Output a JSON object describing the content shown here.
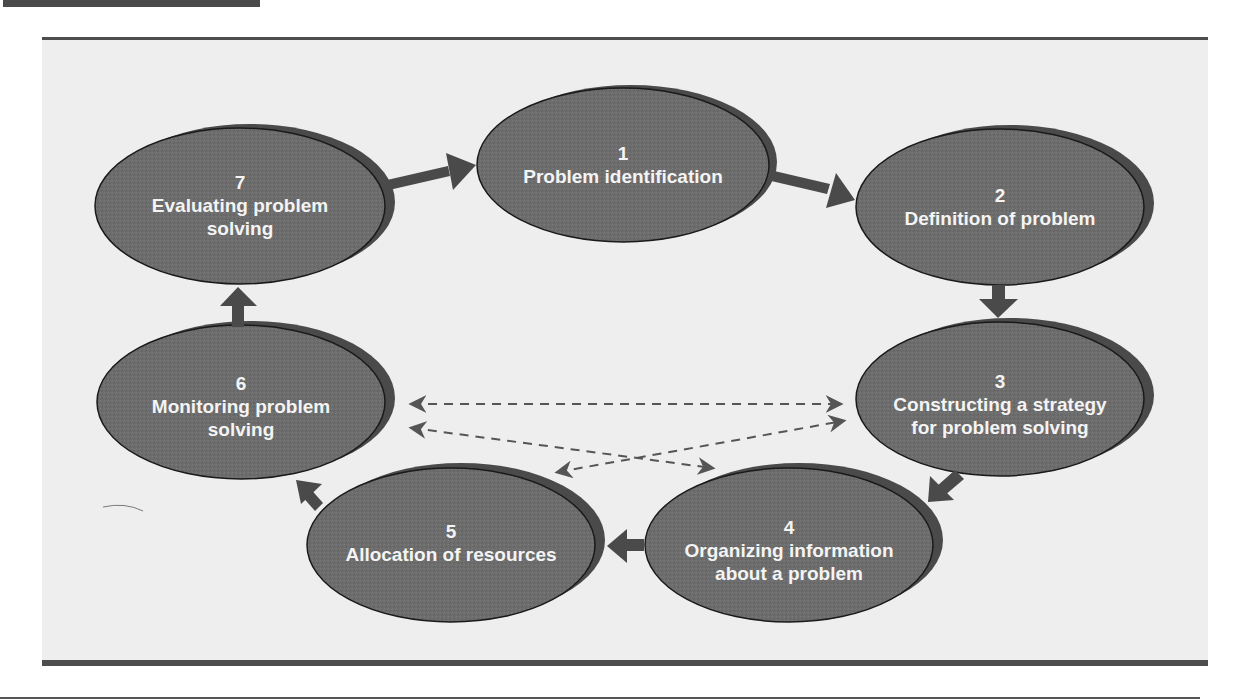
{
  "diagram": {
    "type": "cycle",
    "colors": {
      "node_fill": "#6b6b6b",
      "node_shadow": "#4a4a4a",
      "node_outline": "#1a1a1a",
      "arrow": "#4a4a4a",
      "dashed_arrow": "#555555",
      "label_text": "#f4f4f4",
      "panel_bg": "#eeeeee",
      "border": "#4d4d4d"
    },
    "nodes": [
      {
        "id": "1",
        "number": "1",
        "lines": [
          "Problem identification"
        ]
      },
      {
        "id": "2",
        "number": "2",
        "lines": [
          "Definition of problem"
        ]
      },
      {
        "id": "3",
        "number": "3",
        "lines": [
          "Constructing a strategy",
          "for problem solving"
        ]
      },
      {
        "id": "4",
        "number": "4",
        "lines": [
          "Organizing information",
          "about a problem"
        ]
      },
      {
        "id": "5",
        "number": "5",
        "lines": [
          "Allocation of resources"
        ]
      },
      {
        "id": "6",
        "number": "6",
        "lines": [
          "Monitoring problem",
          "solving"
        ]
      },
      {
        "id": "7",
        "number": "7",
        "lines": [
          "Evaluating problem",
          "solving"
        ]
      }
    ],
    "edges": [
      {
        "from": "1",
        "to": "2",
        "style": "solid"
      },
      {
        "from": "2",
        "to": "3",
        "style": "solid"
      },
      {
        "from": "3",
        "to": "4",
        "style": "solid"
      },
      {
        "from": "4",
        "to": "5",
        "style": "solid"
      },
      {
        "from": "5",
        "to": "6",
        "style": "solid"
      },
      {
        "from": "6",
        "to": "7",
        "style": "solid"
      },
      {
        "from": "7",
        "to": "1",
        "style": "solid"
      },
      {
        "from": "6",
        "to": "3",
        "style": "dashed",
        "bidirectional": true
      },
      {
        "from": "6",
        "to": "4",
        "style": "dashed",
        "bidirectional": true
      },
      {
        "from": "5",
        "to": "3",
        "style": "dashed",
        "bidirectional": true
      }
    ]
  }
}
